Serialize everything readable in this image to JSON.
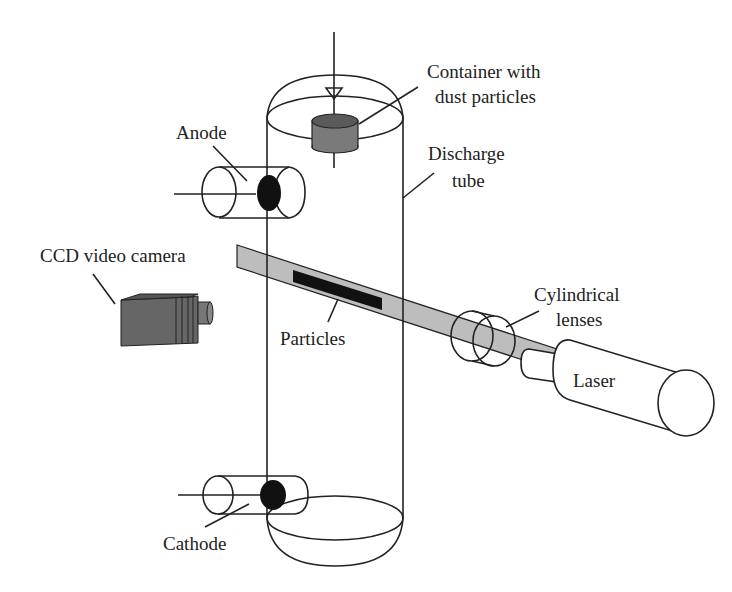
{
  "diagram": {
    "type": "experimental setup schematic",
    "labels": {
      "container": [
        "Container with",
        "dust particles"
      ],
      "discharge_tube": [
        "Discharge",
        "tube"
      ],
      "anode": "Anode",
      "ccd_camera": "CCD video camera",
      "particles": "Particles",
      "cylindrical_lenses": [
        "Cylindrical",
        "lenses"
      ],
      "laser": "Laser",
      "cathode": "Cathode"
    },
    "colors": {
      "outline": "#222222",
      "laser_sheet": "#bdbdbd",
      "container_top": "#5a5a5a",
      "container_side": "#7a7a7a",
      "electrode": "#111111",
      "camera": "#6e6e6e",
      "particle_cloud": "#111111"
    }
  }
}
